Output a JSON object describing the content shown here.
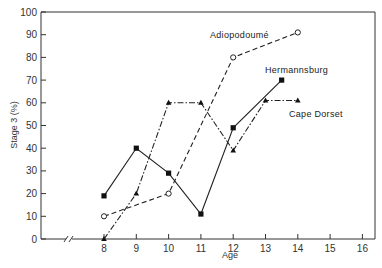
{
  "chart_data": {
    "type": "line",
    "title": "",
    "xlabel": "Age",
    "ylabel": "Stage 3 (%)",
    "xlim": [
      8,
      16
    ],
    "ylim": [
      0,
      100
    ],
    "x_ticks": [
      8,
      9,
      10,
      11,
      12,
      13,
      14,
      15,
      16
    ],
    "y_ticks": [
      0,
      10,
      20,
      30,
      40,
      50,
      60,
      70,
      80,
      90,
      100
    ],
    "axis_break": "//",
    "grid": false,
    "legend_position": "inline labels",
    "series": [
      {
        "name": "Adiopodoumé",
        "line_style": "dashed",
        "marker": "open-circle",
        "x": [
          8,
          10,
          12,
          14
        ],
        "values": [
          10,
          20,
          80,
          91
        ]
      },
      {
        "name": "Hermannsburg",
        "line_style": "solid",
        "marker": "filled-square",
        "x": [
          8,
          9,
          10,
          11,
          12,
          13.5
        ],
        "values": [
          19,
          40,
          29,
          11,
          49,
          70
        ]
      },
      {
        "name": "Cape Dorset",
        "line_style": "dash-dot",
        "marker": "filled-triangle",
        "x": [
          8,
          9,
          10,
          11,
          12,
          13,
          14
        ],
        "values": [
          0,
          20,
          60,
          60,
          39,
          61,
          61
        ]
      }
    ]
  }
}
